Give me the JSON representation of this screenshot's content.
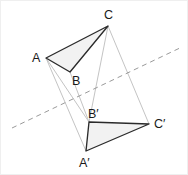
{
  "figure": {
    "background_color": "#ffffff",
    "width": 188,
    "height": 175,
    "stroke_color": "#2b2b2b",
    "fill_color": "#f2f2f2",
    "connector_color": "#c4c4c4",
    "axis_color": "#9a9a9a",
    "label_color": "#1a1a1a"
  },
  "labels": {
    "A": "A",
    "B": "B",
    "C": "C",
    "A_prime": "A′",
    "B_prime": "B′",
    "C_prime": "C′"
  },
  "points": {
    "A": {
      "x": 46,
      "y": 58,
      "label_x": 32,
      "label_y": 62
    },
    "B": {
      "x": 70,
      "y": 72,
      "label_x": 72,
      "label_y": 85
    },
    "C": {
      "x": 108,
      "y": 26,
      "label_x": 104,
      "label_y": 19
    },
    "A_prime": {
      "x": 86,
      "y": 151,
      "label_x": 79,
      "label_y": 167
    },
    "B_prime": {
      "x": 89,
      "y": 122,
      "label_x": 88,
      "label_y": 118
    },
    "C_prime": {
      "x": 149,
      "y": 124,
      "label_x": 154,
      "label_y": 128
    }
  },
  "shapes": {
    "triangle_abc": "46,58 70,72 108,26",
    "triangle_abc_prime": "86,151 89,122 149,124",
    "connector_a_aprime": {
      "x1": 46,
      "y1": 58,
      "x2": 86,
      "y2": 151
    },
    "connector_b_bprime": {
      "x1": 70,
      "y1": 72,
      "x2": 89,
      "y2": 122
    },
    "connector_c_cprime": {
      "x1": 108,
      "y1": 26,
      "x2": 149,
      "y2": 124
    },
    "axis_line": {
      "x1": 12,
      "y1": 128,
      "x2": 182,
      "y2": 47
    }
  }
}
